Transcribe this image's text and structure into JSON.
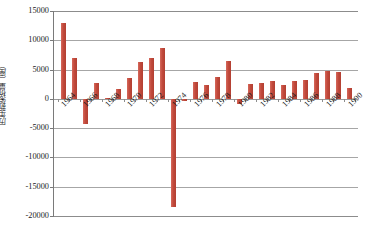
{
  "chart_data": {
    "type": "bar",
    "title": "",
    "subtitle": "",
    "xlabel": "",
    "ylabel": "历年新架桥量（座）",
    "ylim": [
      -20000,
      15000
    ],
    "ytick_labels": [
      "15000",
      "10000",
      "5000",
      "0",
      "-5000",
      "-10000",
      "-15000",
      "-20000"
    ],
    "ytick_values": [
      15000,
      10000,
      5000,
      0,
      -5000,
      -10000,
      -15000,
      -20000
    ],
    "grid": true,
    "legend": "none",
    "bar_color": "#C0504D",
    "axis_color": "#8c8c8c",
    "categories": [
      "1964",
      "1965",
      "1966",
      "1967",
      "1968",
      "1969",
      "1970",
      "1971",
      "1972",
      "1973",
      "1974",
      "1975",
      "1976",
      "1977",
      "1978",
      "1979",
      "1980",
      "1981",
      "1982",
      "1983",
      "1984",
      "1985",
      "1986",
      "1987",
      "1988",
      "1989",
      "1990"
    ],
    "xtick_labels": [
      "1964",
      "1966",
      "1968",
      "1970",
      "1972",
      "1974",
      "1976",
      "1978",
      "1980",
      "1982",
      "1984",
      "1986",
      "1988",
      "1990"
    ],
    "values": [
      13000,
      7000,
      -4300,
      2700,
      200,
      1600,
      3500,
      6300,
      7000,
      8600,
      -18500,
      -400,
      2900,
      2400,
      3800,
      6400,
      -900,
      2600,
      2700,
      3100,
      2400,
      3100,
      3200,
      4500,
      4700,
      4600,
      1900
    ],
    "series": [
      {
        "name": "历年新架桥量",
        "values": [
          13000,
          7000,
          -4300,
          2700,
          200,
          1600,
          3500,
          6300,
          7000,
          8600,
          -18500,
          -400,
          2900,
          2400,
          3800,
          6400,
          -900,
          2600,
          2700,
          3100,
          2400,
          3100,
          3200,
          4500,
          4700,
          4600,
          1900
        ]
      }
    ]
  }
}
